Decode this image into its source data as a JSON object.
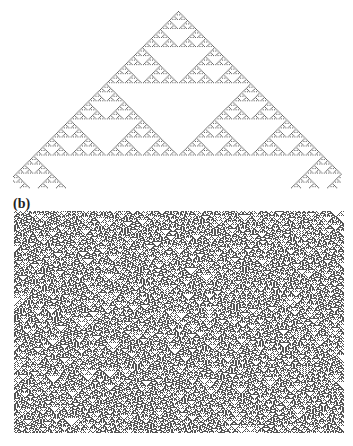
{
  "figure": {
    "panels": [
      {
        "label": "(a)",
        "description": "Elementary cellular automaton evolved from a single seed cell, producing a Sierpinski-triangle pattern",
        "rule": 90,
        "initial_condition": "single-seed",
        "cell_color": "#555555",
        "background_color": "#ffffff"
      },
      {
        "label": "(b)",
        "description": "Elementary cellular automaton evolved from a random initial condition, producing a dense field of nested triangles",
        "rule": 90,
        "initial_condition": "random",
        "cell_color": "#555555",
        "background_color": "#ffffff"
      }
    ]
  }
}
